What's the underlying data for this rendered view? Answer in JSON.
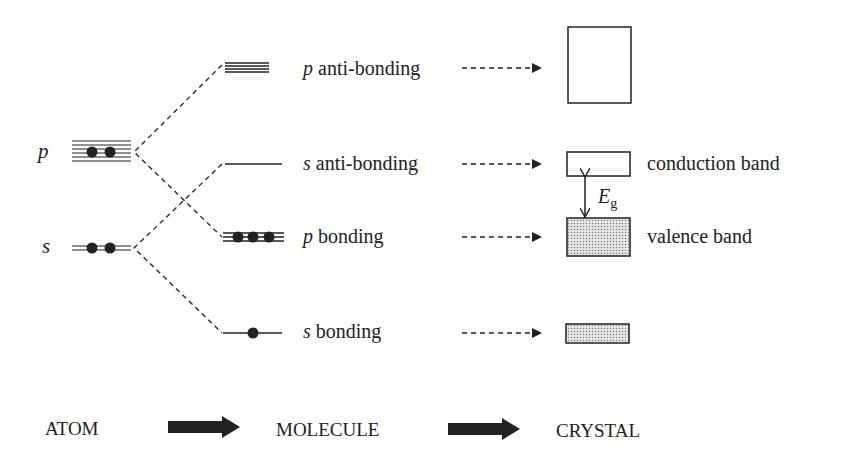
{
  "diagram": {
    "type": "energy-level / band formation",
    "atom": {
      "levels": [
        {
          "symbol": "p",
          "electrons": 2
        },
        {
          "symbol": "s",
          "electrons": 2
        }
      ]
    },
    "molecule": {
      "levels": [
        {
          "symbol": "p",
          "text": " anti-bonding",
          "electrons": 0
        },
        {
          "symbol": "s",
          "text": " anti-bonding",
          "electrons": 0
        },
        {
          "symbol": "p",
          "text": " bonding",
          "electrons": 3
        },
        {
          "symbol": "s",
          "text": " bonding",
          "electrons": 1
        }
      ]
    },
    "crystal": {
      "conduction_label": "conduction band",
      "valence_label": "valence band",
      "gap_symbol": "E",
      "gap_subscript": "g"
    },
    "stages": [
      "ATOM",
      "MOLECULE",
      "CRYSTAL"
    ],
    "colors": {
      "ink": "#222222",
      "fill": "#d8d8d8"
    }
  }
}
